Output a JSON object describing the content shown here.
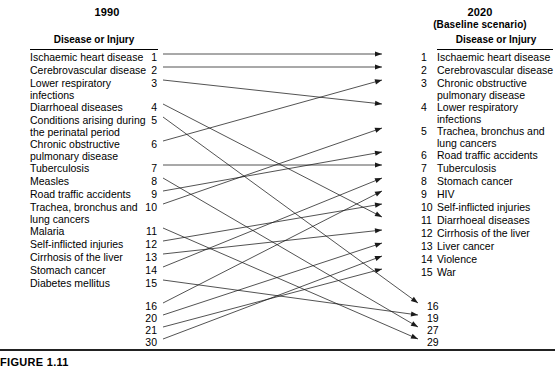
{
  "figure": {
    "caption": "FIGURE 1.11"
  },
  "left_panel": {
    "year": "1990",
    "column_header": "Disease or Injury",
    "rows": [
      {
        "rank": "1",
        "label": "Ischaemic heart disease",
        "y": 58
      },
      {
        "rank": "2",
        "label": "Cerebrovascular disease",
        "y": 71
      },
      {
        "rank": "3",
        "label": "Lower respiratory\ninfections",
        "y": 84
      },
      {
        "rank": "4",
        "label": "Diarrhoeal diseases",
        "y": 108
      },
      {
        "rank": "5",
        "label": "Conditions arising during\nthe perinatal period",
        "y": 121
      },
      {
        "rank": "6",
        "label": "Chronic obstructive\npulmonary disease",
        "y": 145
      },
      {
        "rank": "7",
        "label": "Tuberculosis",
        "y": 169
      },
      {
        "rank": "8",
        "label": "Measles",
        "y": 182
      },
      {
        "rank": "9",
        "label": "Road traffic accidents",
        "y": 195
      },
      {
        "rank": "10",
        "label": "Trachea, bronchus and\nlung cancers",
        "y": 208
      },
      {
        "rank": "11",
        "label": "Malaria",
        "y": 232
      },
      {
        "rank": "12",
        "label": "Self-inflicted injuries",
        "y": 245
      },
      {
        "rank": "13",
        "label": "Cirrhosis of the liver",
        "y": 258
      },
      {
        "rank": "14",
        "label": "Stomach cancer",
        "y": 271
      },
      {
        "rank": "15",
        "label": "Diabetes mellitus",
        "y": 284
      }
    ],
    "extra_ranks": [
      {
        "rank": "16",
        "y": 307
      },
      {
        "rank": "20",
        "y": 319
      },
      {
        "rank": "21",
        "y": 331
      },
      {
        "rank": "30",
        "y": 343
      }
    ]
  },
  "right_panel": {
    "year": "2020",
    "year_sub": "(Baseline scenario)",
    "column_header": "Disease or Injury",
    "rows": [
      {
        "rank": "1",
        "label": "Ischaemic heart disease",
        "y": 58
      },
      {
        "rank": "2",
        "label": "Cerebrovascular disease",
        "y": 71
      },
      {
        "rank": "3",
        "label": "Chronic obstructive\npulmonary disease",
        "y": 84
      },
      {
        "rank": "4",
        "label": "Lower respiratory\ninfections",
        "y": 108
      },
      {
        "rank": "5",
        "label": "Trachea, bronchus and\nlung cancers",
        "y": 132
      },
      {
        "rank": "6",
        "label": "Road traffic accidents",
        "y": 156
      },
      {
        "rank": "7",
        "label": "Tuberculosis",
        "y": 169
      },
      {
        "rank": "8",
        "label": "Stomach cancer",
        "y": 182
      },
      {
        "rank": "9",
        "label": "HIV",
        "y": 195
      },
      {
        "rank": "10",
        "label": "Self-inflicted injuries",
        "y": 208
      },
      {
        "rank": "11",
        "label": "Diarrhoeal diseases",
        "y": 221
      },
      {
        "rank": "12",
        "label": "Cirrhosis of the liver",
        "y": 234
      },
      {
        "rank": "13",
        "label": "Liver cancer",
        "y": 247
      },
      {
        "rank": "14",
        "label": "Violence",
        "y": 260
      },
      {
        "rank": "15",
        "label": "War",
        "y": 273
      }
    ],
    "extra_ranks": [
      {
        "rank": "16",
        "y": 307
      },
      {
        "rank": "19",
        "y": 319
      },
      {
        "rank": "27",
        "y": 331
      },
      {
        "rank": "29",
        "y": 343
      }
    ]
  },
  "chart_data": {
    "type": "slope",
    "left_axis_label": "1990",
    "right_axis_label": "2020 (Baseline scenario)",
    "links": [
      {
        "from": "1",
        "to": "1",
        "from_label": "Ischaemic heart disease",
        "to_label": "Ischaemic heart disease"
      },
      {
        "from": "2",
        "to": "2",
        "from_label": "Cerebrovascular disease",
        "to_label": "Cerebrovascular disease"
      },
      {
        "from": "3",
        "to": "4",
        "from_label": "Lower respiratory infections",
        "to_label": "Lower respiratory infections"
      },
      {
        "from": "4",
        "to": "11",
        "from_label": "Diarrhoeal diseases",
        "to_label": "Diarrhoeal diseases"
      },
      {
        "from": "5",
        "to": "16",
        "from_label": "Conditions arising during the perinatal period",
        "to_label": "Conditions arising during the perinatal period"
      },
      {
        "from": "6",
        "to": "3",
        "from_label": "Chronic obstructive pulmonary disease",
        "to_label": "Chronic obstructive pulmonary disease"
      },
      {
        "from": "7",
        "to": "7",
        "from_label": "Tuberculosis",
        "to_label": "Tuberculosis"
      },
      {
        "from": "8",
        "to": "27",
        "from_label": "Measles",
        "to_label": "Measles"
      },
      {
        "from": "9",
        "to": "6",
        "from_label": "Road traffic accidents",
        "to_label": "Road traffic accidents"
      },
      {
        "from": "10",
        "to": "5",
        "from_label": "Trachea, bronchus and lung cancers",
        "to_label": "Trachea, bronchus and lung cancers"
      },
      {
        "from": "11",
        "to": "29",
        "from_label": "Malaria",
        "to_label": "Malaria"
      },
      {
        "from": "12",
        "to": "10",
        "from_label": "Self-inflicted injuries",
        "to_label": "Self-inflicted injuries"
      },
      {
        "from": "13",
        "to": "12",
        "from_label": "Cirrhosis of the liver",
        "to_label": "Cirrhosis of the liver"
      },
      {
        "from": "14",
        "to": "8",
        "from_label": "Stomach cancer",
        "to_label": "Stomach cancer"
      },
      {
        "from": "15",
        "to": "19",
        "from_label": "Diabetes mellitus",
        "to_label": "Diabetes mellitus"
      },
      {
        "from": "16",
        "to": "9",
        "from_label": "HIV",
        "to_label": "HIV"
      },
      {
        "from": "20",
        "to": "13",
        "from_label": "Liver cancer",
        "to_label": "Liver cancer"
      },
      {
        "from": "21",
        "to": "15",
        "from_label": "War",
        "to_label": "War"
      },
      {
        "from": "30",
        "to": "14",
        "from_label": "Violence",
        "to_label": "Violence"
      }
    ]
  }
}
